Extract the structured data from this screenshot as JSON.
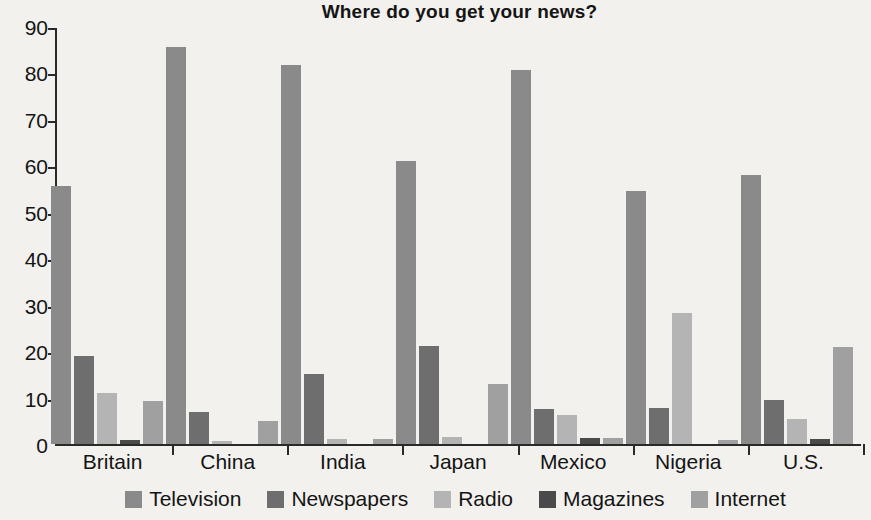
{
  "chart_data": {
    "type": "bar",
    "title": "Where do you get your news?",
    "xlabel": "",
    "ylabel": "",
    "ylim": [
      0,
      90
    ],
    "yticks": [
      0,
      10,
      20,
      30,
      40,
      50,
      60,
      70,
      80,
      90
    ],
    "grid": false,
    "legend_position": "bottom",
    "categories": [
      "Britain",
      "China",
      "India",
      "Japan",
      "Mexico",
      "Nigeria",
      "U.S."
    ],
    "series": [
      {
        "name": "Television",
        "color": "#8a8a8a",
        "values": [
          55.5,
          85.5,
          81.5,
          61.0,
          80.5,
          54.5,
          58.0
        ]
      },
      {
        "name": "Newspapers",
        "color": "#6e6e6e",
        "values": [
          19.0,
          7.0,
          15.0,
          21.0,
          7.5,
          7.8,
          9.5
        ]
      },
      {
        "name": "Radio",
        "color": "#b4b4b4",
        "values": [
          11.0,
          0.7,
          1.0,
          1.5,
          6.3,
          28.3,
          5.3
        ]
      },
      {
        "name": "Magazines",
        "color": "#4a4a4a",
        "values": [
          0.8,
          0.0,
          0.0,
          0.0,
          1.2,
          0.0,
          1.0
        ]
      },
      {
        "name": "Internet",
        "color": "#a0a0a0",
        "values": [
          9.3,
          5.0,
          1.0,
          13.0,
          1.3,
          0.8,
          20.8
        ]
      }
    ]
  },
  "axis": {
    "tick_labels": [
      "0",
      "10",
      "20",
      "30",
      "40",
      "50",
      "60",
      "70",
      "80",
      "90"
    ]
  }
}
